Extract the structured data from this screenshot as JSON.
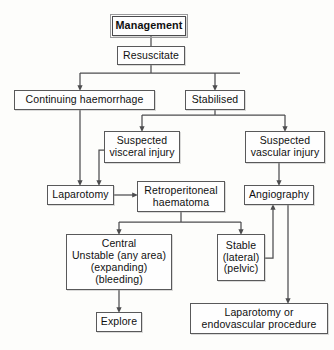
{
  "diagram": {
    "title": "Management",
    "type": "flowchart",
    "accent_color": "#59595a",
    "background_color": "#fdfdfb",
    "nodes": [
      {
        "id": "management",
        "lines": [
          "Management"
        ],
        "emphasis": true,
        "x": 112,
        "y": 16,
        "w": 74,
        "h": 20
      },
      {
        "id": "resuscitate",
        "lines": [
          "Resuscitate"
        ],
        "emphasis": false,
        "x": 117,
        "y": 46,
        "w": 68,
        "h": 19
      },
      {
        "id": "continuing",
        "lines": [
          "Continuing haemorrhage"
        ],
        "emphasis": false,
        "x": 14,
        "y": 90,
        "w": 141,
        "h": 20
      },
      {
        "id": "stabilised",
        "lines": [
          "Stabilised"
        ],
        "emphasis": false,
        "x": 185,
        "y": 90,
        "w": 60,
        "h": 20
      },
      {
        "id": "visceral",
        "lines": [
          "Suspected",
          "visceral injury"
        ],
        "emphasis": false,
        "x": 104,
        "y": 131,
        "w": 76,
        "h": 32
      },
      {
        "id": "vascular",
        "lines": [
          "Suspected",
          "vascular injury"
        ],
        "emphasis": false,
        "x": 245,
        "y": 131,
        "w": 80,
        "h": 32
      },
      {
        "id": "laparotomy",
        "lines": [
          "Laparotomy"
        ],
        "emphasis": false,
        "x": 47,
        "y": 185,
        "w": 67,
        "h": 20
      },
      {
        "id": "retro",
        "lines": [
          "Retroperitoneal",
          "haematoma"
        ],
        "emphasis": false,
        "x": 137,
        "y": 181,
        "w": 88,
        "h": 31
      },
      {
        "id": "angiography",
        "lines": [
          "Angiography"
        ],
        "emphasis": false,
        "x": 244,
        "y": 185,
        "w": 70,
        "h": 20
      },
      {
        "id": "central",
        "lines": [
          "Central",
          "Unstable (any area)",
          "(expanding)",
          "(bleeding)"
        ],
        "emphasis": false,
        "x": 66,
        "y": 234,
        "w": 106,
        "h": 56
      },
      {
        "id": "stable",
        "lines": [
          "Stable",
          "(lateral)",
          "(pelvic)"
        ],
        "emphasis": false,
        "x": 217,
        "y": 234,
        "w": 48,
        "h": 47
      },
      {
        "id": "explore",
        "lines": [
          "Explore"
        ],
        "emphasis": false,
        "x": 96,
        "y": 312,
        "w": 46,
        "h": 20
      },
      {
        "id": "lap_endo",
        "lines": [
          "Laparotomy or",
          "endovascular procedure"
        ],
        "emphasis": false,
        "x": 190,
        "y": 303,
        "w": 138,
        "h": 31
      }
    ],
    "edges": [
      {
        "from": "management",
        "to": "resuscitate",
        "arrow": false
      },
      {
        "from": "resuscitate",
        "to": "continuing",
        "arrow": true
      },
      {
        "from": "resuscitate",
        "to": "stabilised",
        "arrow": true
      },
      {
        "from": "stabilised",
        "to": "visceral",
        "arrow": true
      },
      {
        "from": "stabilised",
        "to": "vascular",
        "arrow": true
      },
      {
        "from": "continuing",
        "to": "laparotomy",
        "arrow": true
      },
      {
        "from": "visceral",
        "to": "laparotomy",
        "arrow": true
      },
      {
        "from": "laparotomy",
        "to": "retro",
        "arrow": true
      },
      {
        "from": "vascular",
        "to": "angiography",
        "arrow": true
      },
      {
        "from": "retro",
        "to": "central",
        "arrow": true
      },
      {
        "from": "retro",
        "to": "stable",
        "arrow": true
      },
      {
        "from": "stable",
        "to": "angiography",
        "arrow": true
      },
      {
        "from": "central",
        "to": "explore",
        "arrow": true
      },
      {
        "from": "angiography",
        "to": "lap_endo",
        "arrow": true
      }
    ]
  }
}
